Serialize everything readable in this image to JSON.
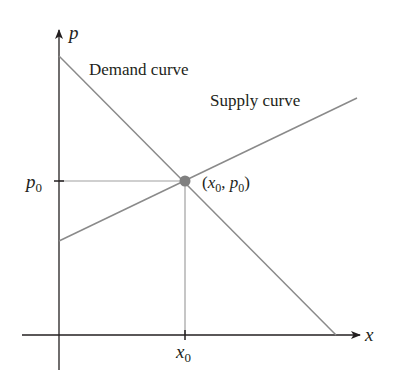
{
  "diagram": {
    "title": "",
    "axes": {
      "x_label": "x",
      "y_label": "p"
    },
    "curves": {
      "demand": {
        "label": "Demand curve"
      },
      "supply": {
        "label": "Supply curve"
      }
    },
    "equilibrium": {
      "label": "(x0, p0)",
      "label_parts": {
        "open": "(",
        "x": "x",
        "x_sub": "0",
        "sep": ", ",
        "p": "p",
        "p_sub": "0",
        "close": ")"
      }
    },
    "ticks": {
      "p0": {
        "main": "p",
        "sub": "0"
      },
      "x0": {
        "main": "x",
        "sub": "0"
      }
    },
    "colors": {
      "axis": "#231f20",
      "curve": "#8a8a8a",
      "guide": "#a0a0a0",
      "point": "#808080"
    }
  }
}
